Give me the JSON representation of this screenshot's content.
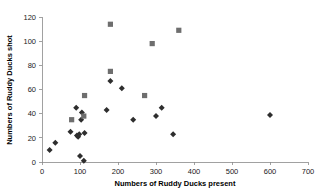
{
  "chart_data": {
    "type": "scatter",
    "title": "",
    "xlabel": "Numbers of Ruddy Ducks present",
    "ylabel": "Numbers of Ruddy Ducks shot",
    "xlim": [
      0,
      700
    ],
    "ylim": [
      0,
      120
    ],
    "xticks": [
      0,
      100,
      200,
      300,
      400,
      500,
      600,
      700
    ],
    "yticks": [
      0,
      20,
      40,
      60,
      80,
      100,
      120
    ],
    "xtick_labels": [
      "0",
      "100",
      "200",
      "300",
      "400",
      "500",
      "600",
      "700"
    ],
    "ytick_labels": [
      "0",
      "20",
      "40",
      "60",
      "80",
      "100",
      "120"
    ],
    "grid": false,
    "legend": "none",
    "series": [
      {
        "name": "diamond-series",
        "marker": "diamond",
        "color": "#2e2e2e",
        "points": [
          {
            "x": 20,
            "y": 10
          },
          {
            "x": 35,
            "y": 16
          },
          {
            "x": 75,
            "y": 25
          },
          {
            "x": 90,
            "y": 45
          },
          {
            "x": 92,
            "y": 22
          },
          {
            "x": 95,
            "y": 21
          },
          {
            "x": 98,
            "y": 23
          },
          {
            "x": 100,
            "y": 5
          },
          {
            "x": 103,
            "y": 35
          },
          {
            "x": 105,
            "y": 41
          },
          {
            "x": 110,
            "y": 1
          },
          {
            "x": 112,
            "y": 24
          },
          {
            "x": 170,
            "y": 43
          },
          {
            "x": 180,
            "y": 67
          },
          {
            "x": 210,
            "y": 61
          },
          {
            "x": 240,
            "y": 35
          },
          {
            "x": 300,
            "y": 38
          },
          {
            "x": 315,
            "y": 45
          },
          {
            "x": 345,
            "y": 23
          },
          {
            "x": 600,
            "y": 39
          }
        ]
      },
      {
        "name": "square-series",
        "marker": "square",
        "color": "#6e6e6e",
        "points": [
          {
            "x": 78,
            "y": 35
          },
          {
            "x": 110,
            "y": 38
          },
          {
            "x": 112,
            "y": 55
          },
          {
            "x": 180,
            "y": 114
          },
          {
            "x": 180,
            "y": 75
          },
          {
            "x": 270,
            "y": 55
          },
          {
            "x": 290,
            "y": 98
          },
          {
            "x": 360,
            "y": 109
          }
        ]
      }
    ]
  }
}
